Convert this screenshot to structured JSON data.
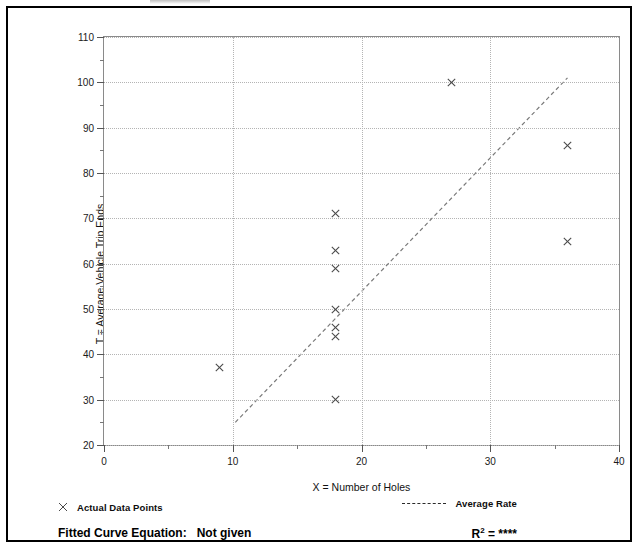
{
  "figure": {
    "background_color": "#ffffff",
    "border_color": "#000000",
    "marker_color": "#4a4a4a",
    "gridline_color": "#b4b4b4",
    "axis_color": "#8a8a8a"
  },
  "axes": {
    "y_title": "T = Average Vehicle Trip Ends",
    "x_title": "X = Number of Holes",
    "y_ticks": [
      20,
      30,
      40,
      50,
      60,
      70,
      80,
      90,
      100,
      110
    ],
    "y_minor_ticks": [
      25,
      35,
      45,
      55,
      65,
      75,
      85,
      95,
      105
    ],
    "x_ticks": [
      0,
      10,
      20,
      30,
      40
    ],
    "x_minor_ticks": [
      5,
      15,
      25,
      35
    ]
  },
  "legend": {
    "data_points_label": "Actual Data Points",
    "data_points_marker": "x-marker-icon",
    "average_rate_label": "Average Rate",
    "average_rate_marker": "dashed-line-icon"
  },
  "footer": {
    "fitted_curve_label": "Fitted Curve Equation:",
    "fitted_curve_value": "Not given",
    "r_squared_label": "R",
    "r_squared_exponent": "2",
    "r_squared_equals": "=",
    "r_squared_value": "****"
  },
  "chart_data": {
    "type": "scatter",
    "title": "",
    "subtitle": "",
    "xlabel": "X = Number of Holes",
    "ylabel": "T = Average Vehicle Trip Ends",
    "xlim": [
      0,
      40
    ],
    "ylim": [
      20,
      110
    ],
    "xticks": [
      0,
      10,
      20,
      30,
      40
    ],
    "yticks": [
      20,
      30,
      40,
      50,
      60,
      70,
      80,
      90,
      100,
      110
    ],
    "grid": true,
    "legend_position": "below-axes",
    "series": [
      {
        "name": "Actual Data Points",
        "type": "scatter",
        "marker": "x",
        "color": "#4a4a4a",
        "points": [
          {
            "x": 9,
            "y": 37
          },
          {
            "x": 18,
            "y": 71
          },
          {
            "x": 18,
            "y": 63
          },
          {
            "x": 18,
            "y": 59
          },
          {
            "x": 18,
            "y": 50
          },
          {
            "x": 18,
            "y": 46
          },
          {
            "x": 18,
            "y": 44
          },
          {
            "x": 18,
            "y": 30
          },
          {
            "x": 27,
            "y": 100
          },
          {
            "x": 36,
            "y": 86
          },
          {
            "x": 36,
            "y": 65
          }
        ]
      },
      {
        "name": "Average Rate",
        "type": "line",
        "linestyle": "dashed",
        "color": "#7a7a7a",
        "points": [
          {
            "x": 10.2,
            "y": 25
          },
          {
            "x": 36.0,
            "y": 101
          }
        ]
      }
    ],
    "annotations": [
      {
        "text": "Fitted Curve Equation:  Not given",
        "position": "bottom-left"
      },
      {
        "text": "R2 = ****",
        "position": "bottom-right"
      }
    ]
  }
}
